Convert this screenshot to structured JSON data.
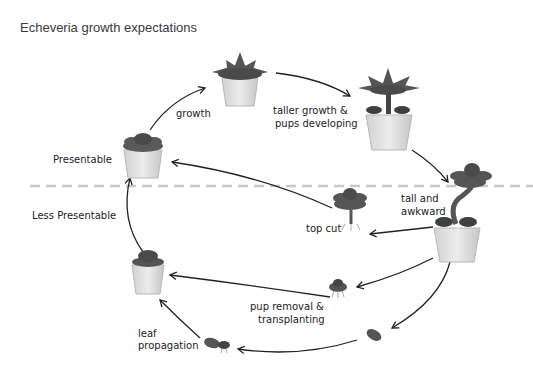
{
  "title": "Echeveria growth expectations",
  "divider": {
    "upper_label": "Presentable",
    "lower_label": "Less Presentable",
    "color": "#c8c8c8"
  },
  "stages": [
    {
      "id": "small-rosette",
      "label": ""
    },
    {
      "id": "medium-rosette",
      "label": ""
    },
    {
      "id": "taller-plant",
      "label": ""
    },
    {
      "id": "leggy-plant",
      "label": ""
    },
    {
      "id": "top-cutting",
      "label": ""
    },
    {
      "id": "pup",
      "label": ""
    },
    {
      "id": "leaf",
      "label": ""
    },
    {
      "id": "leaf-with-rosette",
      "label": ""
    },
    {
      "id": "replanted-rosette",
      "label": ""
    }
  ],
  "transitions": {
    "growth": "growth",
    "taller": [
      "taller growth &",
      "pups developing"
    ],
    "tall": [
      "tall and",
      "awkward"
    ],
    "top_cut": "top cut",
    "pup_removal": [
      "pup removal &",
      "transplanting"
    ],
    "leaf_prop": [
      "leaf",
      "propagation"
    ]
  },
  "colors": {
    "leaf": "#5a5a5a",
    "leaf_dark": "#3e3e3e",
    "pot": "#e4e4e4",
    "pot_shade": "#c9c9c9",
    "line": "#222222"
  }
}
